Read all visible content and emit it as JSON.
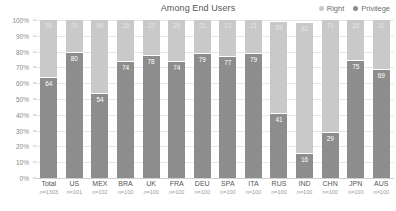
{
  "header": {
    "title": "Among End Users"
  },
  "legend": {
    "position": "top-right",
    "items": [
      {
        "label": "Right",
        "color": "#c9c9c9",
        "icon": "square-swatch"
      },
      {
        "label": "Privilege",
        "color": "#8d8d8d",
        "icon": "square-swatch"
      }
    ]
  },
  "chart_data": {
    "type": "bar",
    "subtype": "stacked-100-percent",
    "title": "Among End Users",
    "xlabel": "",
    "ylabel": "",
    "ylim": [
      0,
      100
    ],
    "ytick_labels": [
      "100%",
      "90%",
      "80%",
      "70%",
      "60%",
      "50%",
      "40%",
      "30%",
      "20%",
      "10%",
      "0%"
    ],
    "ytick_values": [
      100,
      90,
      80,
      70,
      60,
      50,
      40,
      30,
      20,
      10,
      0
    ],
    "grid": true,
    "legend_position": "top-right",
    "categories": [
      "Total",
      "US",
      "MEX",
      "BRA",
      "UK",
      "FRA",
      "DEU",
      "SPA",
      "ITA",
      "RUS",
      "IND",
      "CHN",
      "JPN",
      "AUS"
    ],
    "sample_sizes": [
      "n=1303",
      "n=101",
      "n=102",
      "n=100",
      "n=100",
      "n=100",
      "n=100",
      "n=100",
      "n=100",
      "n=100",
      "n=100",
      "n=100",
      "n=100",
      "n=100"
    ],
    "series": [
      {
        "name": "Right",
        "color": "#c9c9c9",
        "values": [
          36,
          20,
          46,
          26,
          22,
          26,
          21,
          23,
          21,
          58,
          82,
          71,
          25,
          31
        ]
      },
      {
        "name": "Privilege",
        "color": "#8d8d8d",
        "values": [
          64,
          80,
          54,
          74,
          78,
          74,
          79,
          77,
          79,
          41,
          16,
          29,
          75,
          69
        ]
      }
    ]
  },
  "colors": {
    "right": "#c9c9c9",
    "privilege": "#8d8d8d",
    "grid": "#e6e6e6",
    "axis_text": "#8a8a8a",
    "title_text": "#555555"
  }
}
